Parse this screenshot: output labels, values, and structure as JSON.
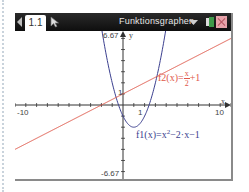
{
  "window": {
    "tab_label": "1.1",
    "title": "Funktionsgraphen",
    "icons": {
      "back": "triangle-left-icon",
      "cursor": "pointer-cursor-icon",
      "dropdown": "dropdown-triangle-icon",
      "battery": "battery-icon",
      "close": "close-icon"
    },
    "colors": {
      "titlebar": "#141414",
      "f1": "#3b3f8f",
      "f2": "#e0584a",
      "axes": "#333333"
    }
  },
  "graph": {
    "xmin": -10,
    "xmax": 10,
    "ymin": -6.67,
    "ymax": 6.67,
    "x_tick_step": 1,
    "y_tick_step": 1,
    "x_axis_label": "x",
    "y_axis_label": "y",
    "tick_labels": {
      "xmin": "-10",
      "xmax": "10",
      "ymax": "6.67",
      "ymin": "-6.67",
      "x_one": "1",
      "y_one": "1"
    },
    "functions": [
      {
        "name": "f1",
        "expr": "x^2-2x-1",
        "label_prefix": "f1",
        "label_arg": "(x)",
        "label_eq": "=x",
        "label_exp": "2",
        "label_rest": "−2·x−1",
        "color": "#3b3f8f"
      },
      {
        "name": "f2",
        "expr": "x/2+1",
        "label_prefix": "f2",
        "label_arg": "(x)",
        "label_eq": "=",
        "label_num": "x",
        "label_den": "2",
        "label_rest": "+1",
        "color": "#e0584a"
      }
    ]
  },
  "chart_data": {
    "type": "line",
    "title": "Funktionsgraphen",
    "xlabel": "x",
    "ylabel": "y",
    "xlim": [
      -10,
      10
    ],
    "ylim": [
      -6.67,
      6.67
    ],
    "grid": false,
    "series": [
      {
        "name": "f1(x)=x^2-2x-1",
        "x": [
          -1.8,
          -1,
          0,
          1,
          2,
          3,
          3.8
        ],
        "values": [
          6.84,
          2,
          -1,
          -2,
          -1,
          2,
          6.84
        ]
      },
      {
        "name": "f2(x)=x/2+1",
        "x": [
          -10,
          -5,
          0,
          5,
          10
        ],
        "values": [
          -4,
          -1.5,
          1,
          3.5,
          6
        ]
      }
    ]
  }
}
